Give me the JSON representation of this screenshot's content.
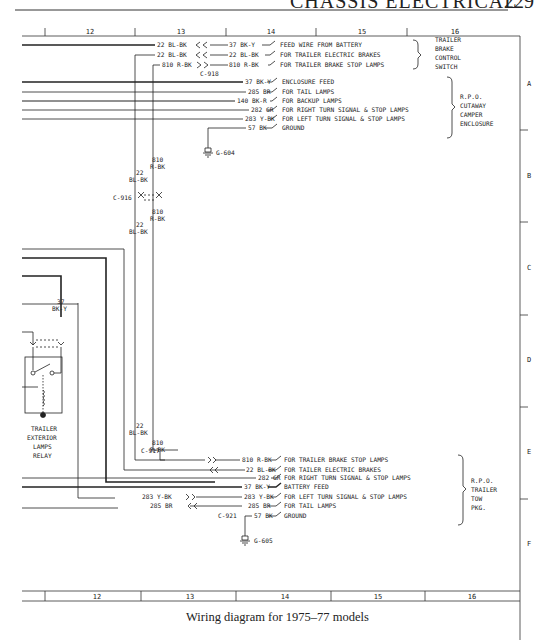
{
  "page": {
    "header_title": "CHASSIS ELECTRICAL",
    "header_page_number": "229",
    "caption": "Wiring diagram for 1975–77 models"
  },
  "grid": {
    "columns": [
      "12",
      "13",
      "14",
      "15",
      "16"
    ],
    "rows": [
      "A",
      "B",
      "C",
      "D",
      "E",
      "F"
    ]
  },
  "connectors": {
    "c918": "C-918",
    "c916": "C-916",
    "c917": "C-917",
    "c921": "C-921"
  },
  "grounds": {
    "g604": "G-604",
    "g605": "G-605"
  },
  "trailer_brake_group": {
    "label": [
      "TRAILER",
      "BRAKE",
      "CONTROL",
      "SWITCH"
    ],
    "rows": [
      {
        "left_wire": "22 BL-BK",
        "right_wire": "37 BK-Y",
        "description": "FEED WIRE FROM BATTERY"
      },
      {
        "left_wire": "22 BL-BK",
        "right_wire": "22 BL-BK",
        "description": "FOR TRAILER ELECTRIC BRAKES"
      },
      {
        "left_wire": "810 R-BK",
        "right_wire": "810 R-BK",
        "description": "FOR TRAILER BRAKE STOP LAMPS"
      }
    ]
  },
  "camper_group": {
    "label": [
      "R.P.O.",
      "CUTAWAY",
      "CAMPER",
      "ENCLOSURE"
    ],
    "rows": [
      {
        "wire": "37 BK-Y",
        "description": "ENCLOSURE FEED"
      },
      {
        "wire": "285 BR",
        "description": "FOR TAIL LAMPS"
      },
      {
        "wire": "140 BK-R",
        "description": "FOR BACKUP LAMPS"
      },
      {
        "wire": "282 GR",
        "description": "FOR RIGHT TURN SIGNAL & STOP LAMPS"
      },
      {
        "wire": "283 Y-BK",
        "description": "FOR LEFT TURN SIGNAL & STOP LAMPS"
      },
      {
        "wire": "57 BK",
        "description": "GROUND"
      }
    ]
  },
  "vertical_labels": {
    "w810_top": [
      "810",
      "R-BK"
    ],
    "w22_top": [
      "22",
      "BL-BK"
    ],
    "w810_mid": [
      "810",
      "R-BK"
    ],
    "w22_mid": [
      "22",
      "BL-BK"
    ],
    "w22_low": [
      "22",
      "BL-BK"
    ],
    "w810_low": [
      "810",
      "R-BK"
    ],
    "relay_wire": [
      "37",
      "BK-Y"
    ]
  },
  "relay": {
    "label": [
      "TRAILER",
      "EXTERIOR",
      "LAMPS",
      "RELAY"
    ]
  },
  "tow_group": {
    "label": [
      "R.P.O.",
      "TRAILER",
      "TOW",
      "PKG."
    ],
    "rows": [
      {
        "left_wire": "",
        "right_wire": "810 R-BK",
        "description": "FOR TRAILER BRAKE STOP LAMPS"
      },
      {
        "left_wire": "",
        "right_wire": "22 BL-BK",
        "description": "FOR TAILER ELECTRIC BRAKES"
      },
      {
        "left_wire": "",
        "right_wire": "282 GR",
        "description": "FOR RIGHT TURN SIGNAL & STOP LAMPS"
      },
      {
        "left_wire": "",
        "right_wire": "37 BK-Y",
        "description": "BATTERY FEED"
      },
      {
        "left_wire": "283 Y-BK",
        "right_wire": "283 Y-BK",
        "description": "FOR LEFT TURN SIGNAL & STOP LAMPS"
      },
      {
        "left_wire": "285 BR",
        "right_wire": "285 BR",
        "description": "FOR TAIL LAMPS"
      },
      {
        "left_wire": "",
        "right_wire": "57 BK",
        "description": "GROUND"
      }
    ]
  },
  "colors": {
    "ink": "#222222",
    "paper": "#ffffff"
  }
}
